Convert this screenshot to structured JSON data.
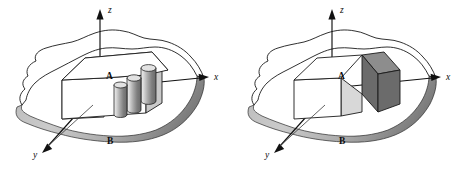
{
  "figure": {
    "background_color": "#ffffff",
    "panel_count": 2
  },
  "colors": {
    "outline": "#1a1a1a",
    "plate_edge_dark": "#8a8a8a",
    "plate_edge_light": "#c4c4c4",
    "block_top_white": "#ffffff",
    "block_side_gray": "#c9c9c9",
    "segment_dark_face": "#6b6b6b",
    "segment_dark_top": "#8d8d8d",
    "segment_light_face": "#d8d8d8",
    "cylinder_light": "#e8e8e8",
    "cylinder_dark": "#6f6f6f",
    "axis": "#111111",
    "label_text": "#0d0d0d"
  },
  "panels": [
    {
      "id": "left",
      "name": "diagram-left-cylinders",
      "description": "Block A on irregular plate B with three short cylinders rising from the block's right end",
      "axes": [
        {
          "id": "z",
          "label": "z",
          "direction": "up",
          "arrow": true
        },
        {
          "id": "x",
          "label": "x",
          "direction": "right",
          "arrow": true
        },
        {
          "id": "y",
          "label": "y",
          "direction": "down-left",
          "arrow": true
        }
      ],
      "parts": [
        {
          "id": "A",
          "label": "A",
          "description": "rectangular block resting on the plate"
        },
        {
          "id": "B",
          "label": "B",
          "description": "irregular flat plate / region"
        }
      ],
      "features": {
        "cylinder_count": 3,
        "cylinder_shading": "vertical gradient, light left to dark right"
      }
    },
    {
      "id": "right",
      "name": "diagram-right-solid-segment",
      "description": "Block A on irregular plate B with a dark solid segment occupying the block's right end",
      "axes": [
        {
          "id": "z",
          "label": "z",
          "direction": "up",
          "arrow": true
        },
        {
          "id": "x",
          "label": "x",
          "direction": "right",
          "arrow": true
        },
        {
          "id": "y",
          "label": "y",
          "direction": "down-left",
          "arrow": true
        }
      ],
      "parts": [
        {
          "id": "A",
          "label": "A",
          "description": "rectangular block resting on the plate"
        },
        {
          "id": "B",
          "label": "B",
          "description": "irregular flat plate / region"
        }
      ],
      "features": {
        "segment_shading": "dark gray solid end block with light gray cut face"
      }
    }
  ],
  "labels": {
    "axis_z": "z",
    "axis_x": "x",
    "axis_y": "y",
    "part_a": "A",
    "part_b": "B"
  }
}
